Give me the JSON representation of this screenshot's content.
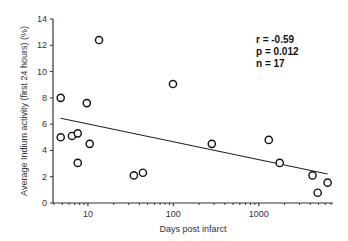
{
  "chart_data": {
    "type": "scatter",
    "title": "",
    "xlabel": "Days post infarct",
    "ylabel": "Average Indium activity (first 24 hours) (%)",
    "xscale": "log",
    "xlim": [
      3.9,
      7400
    ],
    "ylim": [
      0,
      14
    ],
    "xticks": [
      10,
      100,
      1000
    ],
    "xtick_labels": [
      "10",
      "100",
      "1000"
    ],
    "yticks": [
      0,
      2,
      4,
      6,
      8,
      10,
      12,
      14
    ],
    "ytick_labels": [
      "0",
      "2",
      "4",
      "6",
      "8",
      "10",
      "12",
      "14"
    ],
    "grid": false,
    "marker": "open-circle",
    "points": [
      {
        "x": 4.8,
        "y": 8.0
      },
      {
        "x": 4.8,
        "y": 5.0
      },
      {
        "x": 6.5,
        "y": 5.1
      },
      {
        "x": 7.6,
        "y": 5.3
      },
      {
        "x": 7.6,
        "y": 3.05
      },
      {
        "x": 9.7,
        "y": 7.6
      },
      {
        "x": 10.5,
        "y": 4.5
      },
      {
        "x": 13.5,
        "y": 12.4
      },
      {
        "x": 34.5,
        "y": 2.1
      },
      {
        "x": 44,
        "y": 2.3
      },
      {
        "x": 99,
        "y": 9.05
      },
      {
        "x": 282,
        "y": 4.5
      },
      {
        "x": 1310,
        "y": 4.8
      },
      {
        "x": 1760,
        "y": 3.05
      },
      {
        "x": 4260,
        "y": 2.1
      },
      {
        "x": 4900,
        "y": 0.78
      },
      {
        "x": 6400,
        "y": 1.55
      }
    ],
    "regression_line": {
      "x": [
        4.8,
        6400
      ],
      "y": [
        6.45,
        2.2
      ]
    },
    "annotations": [
      "r = -0.59",
      "p = 0.012",
      "n = 17"
    ],
    "annotation_position": "top-right",
    "colors": {
      "axis": "#333333",
      "marker": "#111111",
      "line": "#222222"
    }
  }
}
